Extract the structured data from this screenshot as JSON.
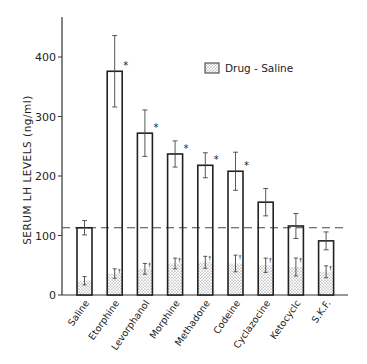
{
  "chart_data": {
    "type": "bar",
    "title": "",
    "xlabel": "",
    "ylabel": "SERUM LH LEVELS (ng/ml)",
    "ylim": [
      0,
      450
    ],
    "yticks": [
      0,
      100,
      200,
      300,
      400
    ],
    "grid": false,
    "legend": {
      "position": "upper-right",
      "entries": [
        "Drug - Saline"
      ]
    },
    "categories": [
      "Saline",
      "Etorphine",
      "Levorphanol",
      "Morphine",
      "Methadone",
      "Codeine",
      "Cyclazocine",
      "Ketocyclc",
      "S.K.F."
    ],
    "series": [
      {
        "name": "Serum LH (total)",
        "style": "open",
        "values": [
          113,
          376,
          272,
          237,
          218,
          208,
          156,
          116,
          91
        ],
        "error": [
          12,
          60,
          39,
          22,
          21,
          32,
          23,
          21,
          15
        ]
      },
      {
        "name": "Drug - Saline",
        "style": "stippled",
        "values": [
          24,
          36,
          44,
          53,
          55,
          53,
          50,
          47,
          39
        ],
        "error": [
          7,
          8,
          9,
          9,
          10,
          14,
          12,
          15,
          10
        ]
      }
    ],
    "significance": [
      false,
      true,
      true,
      true,
      true,
      true,
      false,
      false,
      false
    ],
    "reference_line": {
      "value": 113,
      "style": "dashed",
      "label": "saline level"
    }
  },
  "axis": {
    "ylabel": "SERUM LH LEVELS (ng/ml)",
    "ytick_labels": [
      "0",
      "100",
      "200",
      "300",
      "400"
    ]
  },
  "legend": {
    "label": "Drug - Saline"
  },
  "marks": {
    "significance": "*",
    "dagger": "†"
  }
}
